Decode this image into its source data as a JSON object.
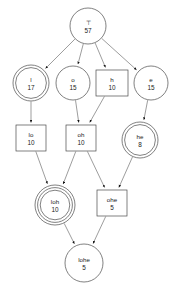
{
  "diagram": {
    "type": "concept-lattice-graph",
    "width": 175,
    "height": 291,
    "background_color": "#ffffff",
    "node_stroke_color": "#4a4a4a",
    "edge_color": "#5a5a5a",
    "text_color": "#1a1a1a",
    "nodes": [
      {
        "id": "top",
        "label": "⊤",
        "count": "57",
        "shape": "circle",
        "cx": 88,
        "cy": 26,
        "r": 18
      },
      {
        "id": "l",
        "label": "l",
        "count": "17",
        "shape": "double-circle",
        "cx": 31,
        "cy": 83,
        "r": 18
      },
      {
        "id": "o",
        "label": "o",
        "count": "15",
        "shape": "circle",
        "cx": 73,
        "cy": 83,
        "r": 17
      },
      {
        "id": "h",
        "label": "h",
        "count": "10",
        "shape": "rect",
        "cx": 112,
        "cy": 83,
        "w": 32,
        "h": 26
      },
      {
        "id": "e",
        "label": "e",
        "count": "15",
        "shape": "circle",
        "cx": 151,
        "cy": 83,
        "r": 17
      },
      {
        "id": "lo",
        "label": "lo",
        "count": "10",
        "shape": "rect",
        "cx": 31,
        "cy": 138,
        "w": 30,
        "h": 26
      },
      {
        "id": "oh",
        "label": "oh",
        "count": "10",
        "shape": "rect",
        "cx": 81,
        "cy": 138,
        "w": 30,
        "h": 26
      },
      {
        "id": "he",
        "label": "he",
        "count": "8",
        "shape": "double-circle",
        "cx": 140,
        "cy": 140,
        "r": 18
      },
      {
        "id": "loh",
        "label": "loh",
        "count": "10",
        "shape": "triple-circle",
        "cx": 55,
        "cy": 205,
        "r": 20
      },
      {
        "id": "ohe",
        "label": "ohe",
        "count": "5",
        "shape": "rect",
        "cx": 112,
        "cy": 203,
        "w": 30,
        "h": 26
      },
      {
        "id": "lohe",
        "label": "lohe",
        "count": "5",
        "shape": "circle",
        "cx": 84,
        "cy": 263,
        "r": 19
      }
    ],
    "edges": [
      {
        "from": "top",
        "to": "l"
      },
      {
        "from": "top",
        "to": "o"
      },
      {
        "from": "top",
        "to": "h"
      },
      {
        "from": "top",
        "to": "e"
      },
      {
        "from": "l",
        "to": "lo"
      },
      {
        "from": "o",
        "to": "oh"
      },
      {
        "from": "h",
        "to": "oh"
      },
      {
        "from": "e",
        "to": "he"
      },
      {
        "from": "lo",
        "to": "loh"
      },
      {
        "from": "oh",
        "to": "loh"
      },
      {
        "from": "oh",
        "to": "ohe"
      },
      {
        "from": "he",
        "to": "ohe"
      },
      {
        "from": "loh",
        "to": "lohe"
      },
      {
        "from": "ohe",
        "to": "lohe"
      }
    ]
  }
}
